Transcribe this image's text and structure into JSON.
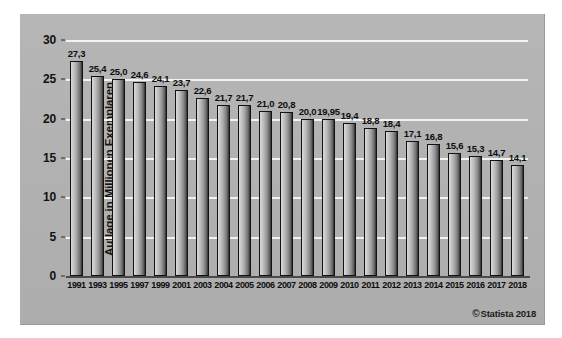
{
  "chart_data": {
    "type": "bar",
    "title": "",
    "subtitle": "",
    "xlabel": "",
    "ylabel": "Auflage in Millionen Exemplaren",
    "ylim": [
      0,
      30
    ],
    "yticks": [
      0,
      5,
      10,
      15,
      20,
      25,
      30
    ],
    "ytick_labels": [
      "0",
      "5",
      "10",
      "15",
      "20",
      "25",
      "30"
    ],
    "grid": "horizontal",
    "legend": "none",
    "categories": [
      "1991",
      "1993",
      "1995",
      "1997",
      "1999",
      "2001",
      "2003",
      "2004",
      "2005",
      "2006",
      "2007",
      "2008",
      "2009",
      "2010",
      "2011",
      "2012",
      "2013",
      "2014",
      "2015",
      "2016",
      "2017",
      "2018"
    ],
    "values": [
      27.3,
      25.4,
      25.0,
      24.6,
      24.1,
      23.7,
      22.6,
      21.7,
      21.7,
      21.0,
      20.8,
      20.0,
      19.95,
      19.4,
      18.8,
      18.4,
      17.1,
      16.8,
      15.6,
      15.3,
      14.7,
      14.1
    ],
    "value_labels": [
      "27,3",
      "25,4",
      "25,0",
      "24,6",
      "24,1",
      "23,7",
      "22,6",
      "21,7",
      "21,7",
      "21,0",
      "20,8",
      "20,0",
      "19,95",
      "19,4",
      "18,8",
      "18,4",
      "17,1",
      "16,8",
      "15,6",
      "15,3",
      "14,7",
      "14,1"
    ],
    "bar_color": "#9d9d9d",
    "bar_edge_color": "#121212",
    "panel_color": "#b3b3b3",
    "gridline_color": "#f2f2f2"
  },
  "credit": {
    "symbol": "©",
    "text": "Statista 2018"
  }
}
